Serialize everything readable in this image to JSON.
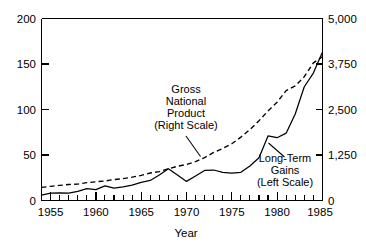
{
  "chart_data": {
    "type": "line",
    "title": "",
    "xlabel": "Year",
    "ylabel": "",
    "grid": false,
    "legend_position": "inline-annotations",
    "x_axis": {
      "label": "Year",
      "ticks": [
        1955,
        1960,
        1965,
        1970,
        1975,
        1980,
        1985
      ],
      "tick_labels": [
        "1955",
        "1960",
        "1965",
        "1970",
        "1975",
        "1980",
        "1985"
      ],
      "minor_tick_interval": 1,
      "xlim": [
        1954,
        1985
      ]
    },
    "y_axis_left": {
      "label": "",
      "ticks": [
        0,
        50,
        100,
        150,
        200
      ],
      "tick_labels": [
        "0",
        "50",
        "100",
        "150",
        "200"
      ],
      "ylim": [
        0,
        200
      ],
      "scale_of": "Long-Term Gains"
    },
    "y_axis_right": {
      "label": "",
      "ticks": [
        0,
        1250,
        2500,
        3750,
        5000
      ],
      "tick_labels": [
        "0",
        "1,250",
        "2,500",
        "3,750",
        "5,000"
      ],
      "ylim": [
        0,
        5000
      ],
      "scale_of": "Gross National Product"
    },
    "series": [
      {
        "name": "Gross National Product",
        "annotation": "Gross National Product (Right Scale)",
        "axis": "right",
        "style": "dashed",
        "x": [
          1954,
          1955,
          1956,
          1957,
          1958,
          1959,
          1960,
          1961,
          1962,
          1963,
          1964,
          1965,
          1966,
          1967,
          1968,
          1969,
          1970,
          1971,
          1972,
          1973,
          1974,
          1975,
          1976,
          1977,
          1978,
          1979,
          1980,
          1981,
          1982,
          1983,
          1984,
          1985
        ],
        "values": [
          360,
          390,
          415,
          440,
          450,
          490,
          515,
          535,
          575,
          600,
          640,
          690,
          755,
          795,
          870,
          940,
          990,
          1070,
          1180,
          1320,
          1430,
          1560,
          1740,
          1950,
          2190,
          2460,
          2700,
          3020,
          3150,
          3400,
          3780,
          3950
        ]
      },
      {
        "name": "Long-Term Gains",
        "annotation": "Long-Term Gains (Left Scale)",
        "axis": "left",
        "style": "solid",
        "x": [
          1954,
          1955,
          1956,
          1957,
          1958,
          1959,
          1960,
          1961,
          1962,
          1963,
          1964,
          1965,
          1966,
          1967,
          1968,
          1969,
          1970,
          1971,
          1972,
          1973,
          1974,
          1975,
          1976,
          1977,
          1978,
          1979,
          1980,
          1981,
          1982,
          1983,
          1984,
          1985
        ],
        "values": [
          6,
          8,
          8.5,
          8,
          10,
          13,
          12,
          16,
          13.5,
          15,
          17,
          20,
          22,
          28,
          35,
          28,
          21,
          27,
          33,
          33.5,
          31,
          30,
          31,
          38,
          47,
          71,
          69,
          74,
          95,
          125,
          140,
          163
        ]
      }
    ],
    "annotations": [
      {
        "name": "gnp-annotation",
        "lines": [
          "Gross",
          "National",
          "Product",
          "(Right Scale)"
        ],
        "text": "Gross National Product (Right Scale)",
        "leader": true
      },
      {
        "name": "gains-annotation",
        "lines": [
          "Long-Term",
          "Gains",
          "(Left Scale)"
        ],
        "text": "Long-Term Gains (Left Scale)",
        "leader": true
      }
    ],
    "colors": {
      "axis": "#000000",
      "series_line": "#000000",
      "background": "#ffffff"
    }
  },
  "labels": {
    "y_left": {
      "t200": "200",
      "t150": "150",
      "t100": "100",
      "t50": "50",
      "t0": "0"
    },
    "y_right": {
      "t5000": "5,000",
      "t3750": "3,750",
      "t2500": "2,500",
      "t1250": "1,250",
      "t0": "0"
    },
    "x": {
      "t1955": "1955",
      "t1960": "1960",
      "t1965": "1965",
      "t1970": "1970",
      "t1975": "1975",
      "t1980": "1980",
      "t1985": "1985"
    },
    "axis_title_x": "Year",
    "gnp": {
      "l1": "Gross",
      "l2": "National",
      "l3": "Product",
      "l4": "(Right Scale)"
    },
    "gains": {
      "l1": "Long-Term",
      "l2": "Gains",
      "l3": "(Left Scale)"
    }
  }
}
